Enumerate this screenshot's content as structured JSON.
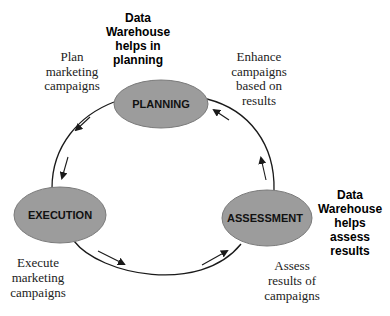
{
  "diagram": {
    "type": "cycle",
    "colors": {
      "node_fill": "#9c9c9c",
      "node_stroke": "#7a7a7a",
      "line": "#1a1a1a",
      "text": "#222222"
    },
    "nodes": [
      {
        "id": "planning",
        "label": "PLANNING"
      },
      {
        "id": "execution",
        "label": "EXECUTION"
      },
      {
        "id": "assessment",
        "label": "ASSESSMENT"
      }
    ],
    "annotations": {
      "plan": [
        "Plan",
        "marketing",
        "campaigns"
      ],
      "dw_planning": [
        "Data",
        "Warehouse",
        "helps in",
        "planning"
      ],
      "enhance": [
        "Enhance",
        "campaigns",
        "based on",
        "results"
      ],
      "execute": [
        "Execute",
        "marketing",
        "campaigns"
      ],
      "assess": [
        "Assess",
        "results of",
        "campaigns"
      ],
      "dw_assess": [
        "Data",
        "Warehouse",
        "helps",
        "assess",
        "results"
      ]
    },
    "flow": [
      "planning",
      "execution",
      "assessment",
      "planning"
    ]
  }
}
